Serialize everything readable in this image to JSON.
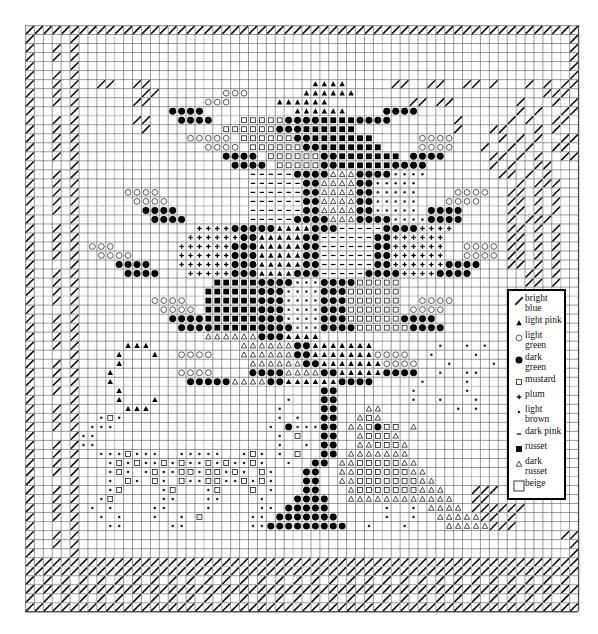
{
  "pattern": {
    "cols": 62,
    "rows": 65,
    "cell_w": 8.92,
    "cell_h": 9.02,
    "border_color": "#222222",
    "grid_color": "#555555",
    "grid_major_color": "#9a9a9a",
    "rows_data": [
      "//////////////////////////////////////////////////////////////",
      "/..../.......................................................//",
      "/.././.......................................................//",
      "/.././.......................................................//",
      "/..../.......................................................//",
      "/.././.......................................................//",
      "/.././..//..//..................^^^^.....//..//..//./.../././/",
      "/.././.......//.......ooo......^^^^^^.....................///",
      "/.././......//......ooo.....^^^^^^.........//.//......./..././",
      "/..../..........@@@@..........^^^^^^....@@@@..........././..//",
      "/.././......//...@@@@...sssss@@@@####@@@@......./....././..//",
      "/.././......./........ssssss@@@######.........../...//..././",
      "/.././............ooooo.ssssss@@#######.....oooo...../././..//",
      "/.././..............oooo.ssssss@@#######....oooo.../.././..//",
      "/.././................@@@@.ssssss@@#######.@@@@.....//././..//",
      "/..../.................@@@@.sssss@@######@@@@......././..//",
      "/.././...................-----@@@@aaa@@@@****........//././",
      "/.././...................------@@aaaa@@*****..........././//",
      "/.././.....oooo..........------@@aaaa@@*****....oooo..//././",
      "/.././......oooo.........------@@aaaa@@*****...oooo...//././",
      "/.././.......@@@@........------@@aaaa@@*****.@@@@.....//././",
      "/..../........@@@@.......-----@@@@aaa@@@@****@@@@....././//",
      "/.././.............++++@@@@@^^^^@@@-----@@@@++++......//././",
      "/.././............++++++@@^^^^^@@------@@++++++.......//././",
      "/.././.ooo.......++++++@@@^^^^^@@------@@++++++..oooo.//././",
      "/.././..oooo.....++++++@@@^^^^^@@------@@++++++..oooo.//././",
      "/..../....@@@@...++++++@@@^^^^^@@------@@++++++@@@@...//././",
      "/.././.....@@@@...+++++@@@^^^^@@@-----@@@@++++@@@@......//./",
      "/.././...............#####@@@@***@@@@sssss..............//./",
      "/.././..............######@@@****@@@ssssss........__________",
      "/.././........oooo..######@@@****@@@ssssss..oooo...|......|",
      "/..../.........oooo.######@@@****@@@ssssss.oooo....|......|",
      "/.././..........@@@@######@@@****@@@ssssss@@@@.....|......|",
      "/.././...........@@@@#####@@@@***@@@@ssssss@@@@....|......|",
      "/.././..............aaaaaa@@@^^^^......................|......|",
      "/.././.....^^^..........aaaaaa@@^^^^^^^.......*..*.*...|......|",
      "/..../....^...^..oooo...aaaaaa@@^^^^^^^oooo..*....*.....|......|",
      "/.././....^..............aaaaaa@@^^^^^^^oooo...*....*....|......|",
      "/.././...^.......oooo....@@@@aaaa@@^^^^^@@@@..*..**.....|......|",
      "/.././...^........@@@@@aaaa@@^^^^^^@@@@.....*....*....|......|",
      "/.././....^......................@@........*.....*...|......|",
      "/..../....^...^..............*...@@........*..*...*...|......|",
      "/.././.....^^^..............*....@@...aa........*.*...|......|",
      "/.././..*s*.................*.*..@@..asa.............|......|",
      "/.././.***.................*.@***@@.aas@ss a.........|......|",
      "/..../**....................*.s..@@..asssa...........|......|",
      "/.././**....................*..*.@@..aasssa..........|......|",
      "/.././..***s***..*****..*s*.*.s..@@.aaaaaaa..........|......|",
      "/.././...*s*s**s*s**s*s**s*..*..@@.aasssssaa.........|......|",
      "/.././...*s*.*s**ss*ss*s*.s*...@@..aassssssaa........|......|",
      "/..../...*.s*.s*.s**ss**s*s*...@@..aasssssssaa.......|......|",
      "/.././...*s....*s...*s...s.*...@@...asssssssaaa...///|......|",
      "/.././..*s.....**...**....*...@@@@..aaaaaaaaaaaa..//.|______|",
      "/.././.*.*....**....*.....**.@@@@@......*..*.aaaa.//////",
      "/.././..*.*...*..*.s.....**.@@@@@@@.....*..*..aaaaa//./",
      "/..../...**.....**.......**@@@@@@@@@..*...*....aaaaa///",
      "/.././......................................................//",
      "/.././.......................................................//",
      "/..../.......................................................//",
      "//////////////////////////////////////////////////////////////",
      "//////////////////////////////////////////////////////////////",
      "/./././././././././././././././././././././././././././././././",
      "//////////////////////////////////////////////////////////////",
      "/./././././././././././././././././././././././././././././././",
      "//////////////////////////////////////////////////////////////"
    ]
  },
  "legend": {
    "items": [
      {
        "code": "/",
        "icon": "slash-icon",
        "label": "bright blue"
      },
      {
        "code": "^",
        "icon": "filled-triangle-icon",
        "label": "light pink"
      },
      {
        "code": "o",
        "icon": "open-circle-icon",
        "label": "light green"
      },
      {
        "code": "@",
        "icon": "filled-circle-icon",
        "label": "dark green"
      },
      {
        "code": "s",
        "icon": "open-square-small-icon",
        "label": "mustard"
      },
      {
        "code": "+",
        "icon": "plus-icon",
        "label": "plum"
      },
      {
        "code": "*",
        "icon": "asterisk-icon",
        "label": "light brown"
      },
      {
        "code": "-",
        "icon": "dash-icon",
        "label": "dark pink"
      },
      {
        "code": "#",
        "icon": "filled-square-icon",
        "label": "russet"
      },
      {
        "code": "a",
        "icon": "open-triangle-icon",
        "label": "dark russet"
      },
      {
        "code": ".",
        "icon": "open-square-large-icon",
        "label": "beige"
      }
    ]
  }
}
